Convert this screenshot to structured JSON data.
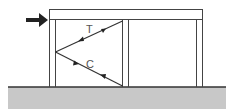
{
  "diagram": {
    "labels": {
      "tension": "T",
      "compression": "C"
    },
    "colors": {
      "line": "#333333",
      "ground": "#c8c8c8",
      "arrow": "#222222",
      "label": "#555555"
    }
  }
}
